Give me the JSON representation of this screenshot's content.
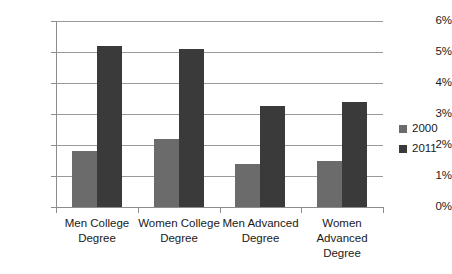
{
  "chart_data": {
    "type": "bar",
    "title": "",
    "subtitle": "",
    "xlabel": "",
    "ylabel": "",
    "categories": [
      "Men College Degree",
      "Women College Degree",
      "Men Advanced Degree",
      "Women Advanced Degree"
    ],
    "series": [
      {
        "name": "2000",
        "color": "#6b6b6b",
        "values": [
          1.8,
          2.2,
          1.4,
          1.5
        ]
      },
      {
        "name": "2011",
        "color": "#3a3a3a",
        "values": [
          5.2,
          5.1,
          3.25,
          3.4
        ]
      }
    ],
    "ylim": [
      0,
      6
    ],
    "ytick_values": [
      0,
      1,
      2,
      3,
      4,
      5,
      6
    ],
    "ytick_labels": [
      "0%",
      "1%",
      "2%",
      "3%",
      "4%",
      "5%",
      "6%"
    ],
    "grid": true,
    "grid_axis": "y",
    "legend_position": "right",
    "value_suffix": "%"
  },
  "axis": {
    "y_ticks": [
      "6%",
      "5%",
      "4%",
      "3%",
      "2%",
      "1%",
      "0%"
    ],
    "x_categories": [
      {
        "lines": [
          "Men College",
          "Degree"
        ]
      },
      {
        "lines": [
          "Women College",
          "Degree"
        ]
      },
      {
        "lines": [
          "Men Advanced",
          "Degree"
        ]
      },
      {
        "lines": [
          "Women",
          "Advanced",
          "Degree"
        ]
      }
    ]
  },
  "legend": {
    "entries": [
      {
        "label": "2000",
        "color": "#6b6b6b"
      },
      {
        "label": "2011",
        "color": "#3a3a3a"
      }
    ]
  }
}
